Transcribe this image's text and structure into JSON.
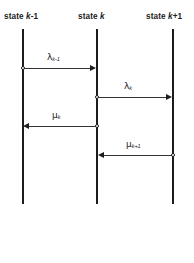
{
  "diagram": {
    "type": "state-transition-rate-diagram",
    "background_color": "#ffffff",
    "line_color": "#1c1c1c",
    "states": [
      {
        "id": "state-k-minus-1",
        "label_prefix": "state ",
        "label_var": "k",
        "label_suffix": "-1",
        "full_label": "state k-1"
      },
      {
        "id": "state-k",
        "label_prefix": "state ",
        "label_var": "k",
        "label_suffix": "",
        "full_label": "state k"
      },
      {
        "id": "state-k-plus-1",
        "label_prefix": "state ",
        "label_var": "k",
        "label_suffix": "+1",
        "full_label": "state k+1"
      }
    ],
    "transitions": [
      {
        "id": "lambda-k-minus-1",
        "symbol": "λ",
        "subscript": "k-1",
        "full_label": "λ k-1",
        "from": "state k-1",
        "to": "state k",
        "direction": "right"
      },
      {
        "id": "lambda-k",
        "symbol": "λ",
        "subscript": "k",
        "full_label": "λ k",
        "from": "state k",
        "to": "state k+1",
        "direction": "right"
      },
      {
        "id": "mu-k",
        "symbol": "μ",
        "subscript": "k",
        "full_label": "μ k",
        "from": "state k",
        "to": "state k-1",
        "direction": "left"
      },
      {
        "id": "mu-k-plus-1",
        "symbol": "μ",
        "subscript": "k+1",
        "full_label": "μ k+1",
        "from": "state k+1",
        "to": "state k",
        "direction": "left"
      }
    ]
  }
}
